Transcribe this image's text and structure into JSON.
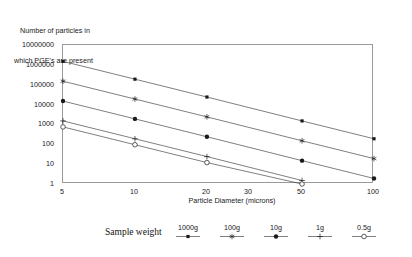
{
  "chart_data": {
    "type": "line",
    "title": "",
    "ylabel": "Number of particles in which PGE's are present",
    "ylabel_line1": "Number of particles in",
    "ylabel_line2": "which PGE's are present",
    "xlabel": "Particle Diameter (microns)",
    "xscale": "log",
    "yscale": "log",
    "xlim": [
      5,
      100
    ],
    "ylim": [
      1,
      10000000
    ],
    "grid": false,
    "legend_position": "bottom",
    "legend_title": "Sample weight",
    "x_ticks": [
      5,
      10,
      20,
      30,
      50,
      100
    ],
    "x_tick_labels": [
      "5",
      "10",
      "20",
      "30",
      "50",
      "100"
    ],
    "y_ticks": [
      1,
      10,
      100,
      1000,
      10000,
      100000,
      1000000,
      10000000
    ],
    "y_tick_labels": [
      "1",
      "10",
      "100",
      "1000",
      "10000",
      "100000",
      "1000000",
      "10000000"
    ],
    "x": [
      5,
      10,
      20,
      50,
      100
    ],
    "series": [
      {
        "name": "1000g",
        "marker": "filled-square-small",
        "color": "#1a1a1a",
        "values": [
          1500000,
          190000,
          24000,
          1500,
          190
        ]
      },
      {
        "name": "100g",
        "marker": "asterisk",
        "color": "#1a1a1a",
        "values": [
          150000,
          19000,
          2400,
          150,
          19
        ]
      },
      {
        "name": "10g",
        "marker": "filled-circle",
        "color": "#1a1a1a",
        "values": [
          15000,
          1900,
          240,
          15,
          1.9
        ]
      },
      {
        "name": "1g",
        "marker": "plus",
        "color": "#1a1a1a",
        "values": [
          1500,
          190,
          24,
          1.5,
          null
        ]
      },
      {
        "name": "0.5g",
        "marker": "open-circle",
        "color": "#1a1a1a",
        "values": [
          750,
          95,
          12,
          1.0,
          null
        ]
      }
    ]
  },
  "legend": {
    "title": "Sample weight",
    "items": [
      {
        "label": "1000g",
        "marker": "filled-square-small"
      },
      {
        "label": "100g",
        "marker": "asterisk"
      },
      {
        "label": "10g",
        "marker": "filled-circle"
      },
      {
        "label": "1g",
        "marker": "plus"
      },
      {
        "label": "0.5g",
        "marker": "open-circle"
      }
    ]
  },
  "colors": {
    "line": "#3a3a3a",
    "frame": "#9a9a9a",
    "text": "#1a1a1a",
    "background": "#ffffff"
  }
}
